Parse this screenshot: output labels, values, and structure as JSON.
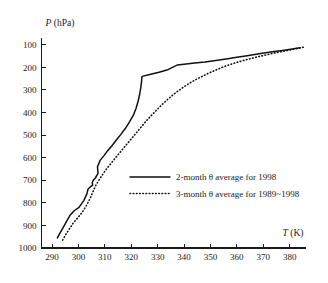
{
  "chart_data": {
    "type": "line",
    "title": "",
    "xlabel": "T (K)",
    "ylabel": "P (hPa)",
    "xlabel_var": "T",
    "xlabel_unit": "(K)",
    "ylabel_var": "P",
    "ylabel_unit": "(hPa)",
    "xlim": [
      286,
      386
    ],
    "ylim": [
      1000,
      70
    ],
    "y_inverted": true,
    "grid": false,
    "legend_position": "center-right",
    "xticks": [
      290,
      300,
      310,
      320,
      330,
      340,
      350,
      360,
      370,
      380
    ],
    "yticks": [
      100,
      200,
      300,
      400,
      500,
      600,
      700,
      800,
      900,
      1000
    ],
    "xtick_labels": [
      "290",
      "300",
      "310",
      "320",
      "330",
      "340",
      "350",
      "360",
      "370",
      "380"
    ],
    "ytick_labels": [
      "100",
      "200",
      "300",
      "400",
      "500",
      "600",
      "700",
      "800",
      "900",
      "1000"
    ],
    "series": [
      {
        "name": "2-month θ average for 1998",
        "style": "solid",
        "color": "#111111",
        "x": [
          292.0,
          293.2,
          294.4,
          295.6,
          296.8,
          298.4,
          300.2,
          302.0,
          303.2,
          303.6,
          304.6,
          305.4,
          305.2,
          305.6,
          306.4,
          307.4,
          307.2,
          308.2,
          309.6,
          311.0,
          312.6,
          314.2,
          316.0,
          317.8,
          319.4,
          320.8,
          321.8,
          322.6,
          323.2,
          323.6,
          323.9,
          324.0,
          324.1,
          327.0,
          330.5,
          333.5,
          336.0,
          337.4,
          340.0,
          344.0,
          348.0,
          352.0,
          356.0,
          360.0,
          364.5,
          369.0,
          373.5,
          378.0,
          381.5,
          384.0
        ],
        "y": [
          955,
          930,
          905,
          880,
          855,
          835,
          820,
          790,
          760,
          740,
          728,
          722,
          712,
          700,
          690,
          670,
          640,
          612,
          592,
          570,
          548,
          524,
          498,
          470,
          440,
          412,
          382,
          350,
          318,
          290,
          262,
          248,
          240,
          232,
          222,
          212,
          198,
          190,
          186,
          181,
          176,
          170,
          163,
          155,
          147,
          139,
          131,
          124,
          118,
          113
        ]
      },
      {
        "name": "3-month θ average for 1989~1998",
        "style": "dotted",
        "color": "#111111",
        "x": [
          294.0,
          295.2,
          296.6,
          298.0,
          299.6,
          301.2,
          302.6,
          303.8,
          304.8,
          305.6,
          306.4,
          307.4,
          308.6,
          310.0,
          311.6,
          313.4,
          315.2,
          317.2,
          319.2,
          321.2,
          323.2,
          325.2,
          327.2,
          329.2,
          331.2,
          333.4,
          335.6,
          337.8,
          340.0,
          342.4,
          344.8,
          347.2,
          349.6,
          352.0,
          354.4,
          356.8,
          359.4,
          362.0,
          365.0,
          368.0,
          371.0,
          374.0,
          377.0,
          380.0,
          383.0,
          385.5
        ],
        "y": [
          965,
          940,
          915,
          890,
          868,
          845,
          820,
          795,
          770,
          748,
          726,
          706,
          684,
          660,
          636,
          610,
          584,
          556,
          528,
          500,
          472,
          444,
          418,
          394,
          370,
          346,
          324,
          304,
          286,
          268,
          252,
          238,
          224,
          212,
          200,
          190,
          180,
          171,
          162,
          153,
          145,
          137,
          130,
          123,
          116,
          110
        ]
      }
    ],
    "legend": [
      {
        "label": "2-month θ average for 1998",
        "style": "solid"
      },
      {
        "label": "3-month θ average for 1989~1998",
        "style": "dotted"
      }
    ]
  }
}
